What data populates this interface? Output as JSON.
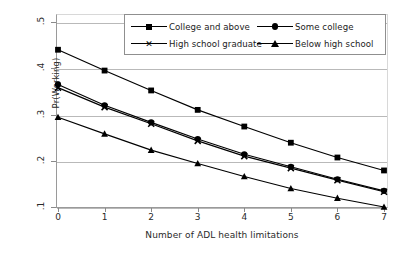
{
  "chart_data": {
    "type": "line",
    "title": "",
    "xlabel": "Number of ADL health limitations",
    "ylabel": "Pr(Working)",
    "x": [
      0,
      1,
      2,
      3,
      4,
      5,
      6,
      7
    ],
    "xticklabels": [
      "0",
      "1",
      "2",
      "3",
      "4",
      "5",
      "6",
      "7"
    ],
    "yticklabels": [
      ".5",
      ".4",
      ".3",
      ".2",
      ".1"
    ],
    "yticks": [
      0.5,
      0.4,
      0.3,
      0.2,
      0.1
    ],
    "xlim": [
      0,
      7
    ],
    "ylim": [
      0.1,
      0.5
    ],
    "grid": "horizontal",
    "legend_position": "top-center-inside",
    "series": [
      {
        "name": "College and above",
        "marker": "square",
        "values": [
          0.44,
          0.395,
          0.352,
          0.31,
          0.274,
          0.239,
          0.207,
          0.179
        ]
      },
      {
        "name": "Some college",
        "marker": "circle",
        "values": [
          0.365,
          0.32,
          0.283,
          0.247,
          0.214,
          0.187,
          0.16,
          0.135
        ]
      },
      {
        "name": "High school graduate",
        "marker": "cross",
        "values": [
          0.358,
          0.316,
          0.28,
          0.243,
          0.21,
          0.184,
          0.158,
          0.133
        ]
      },
      {
        "name": "Below high school",
        "marker": "triangle",
        "values": [
          0.294,
          0.258,
          0.223,
          0.194,
          0.166,
          0.14,
          0.119,
          0.1
        ]
      }
    ],
    "colors": {
      "line": "#000000",
      "marker": "#000000",
      "grid": "#b9b9b9",
      "axis": "#8a8a8a",
      "background": "#ffffff",
      "text": "#2a2a2a"
    }
  },
  "legend": {
    "entries": [
      {
        "label": "College and above",
        "marker": "square-marker"
      },
      {
        "label": "Some college",
        "marker": "circle-marker"
      },
      {
        "label": "High school graduate",
        "marker": "cross-marker"
      },
      {
        "label": "Below high school",
        "marker": "triangle-marker"
      }
    ]
  }
}
